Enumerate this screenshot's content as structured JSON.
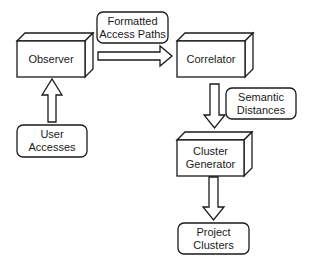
{
  "diagram": {
    "type": "flowchart",
    "colors": {
      "stroke": "#1a1a1a",
      "fill": "#ffffff",
      "text": "#1a1a1a"
    },
    "nodes": {
      "observer": {
        "shape": "3d-box",
        "lines": [
          "Observer"
        ]
      },
      "correlator": {
        "shape": "3d-box",
        "lines": [
          "Correlator"
        ]
      },
      "cluster_generator": {
        "shape": "3d-box",
        "lines": [
          "Cluster",
          "Generator"
        ]
      },
      "user_accesses": {
        "shape": "rounded-rect",
        "lines": [
          "User",
          "Accesses"
        ]
      },
      "formatted_access_paths": {
        "shape": "rounded-rect",
        "lines": [
          "Formatted",
          "Access Paths"
        ]
      },
      "semantic_distances": {
        "shape": "rounded-rect",
        "lines": [
          "Semantic",
          "Distances"
        ]
      },
      "project_clusters": {
        "shape": "rounded-rect",
        "lines": [
          "Project",
          "Clusters"
        ]
      }
    },
    "edges": [
      {
        "from": "User Accesses",
        "to": "Observer",
        "direction": "up"
      },
      {
        "from": "Observer",
        "to": "Correlator",
        "direction": "right",
        "label": "Formatted Access Paths"
      },
      {
        "from": "Correlator",
        "to": "Cluster Generator",
        "direction": "down",
        "label": "Semantic Distances"
      },
      {
        "from": "Cluster Generator",
        "to": "Project Clusters",
        "direction": "down"
      }
    ]
  }
}
